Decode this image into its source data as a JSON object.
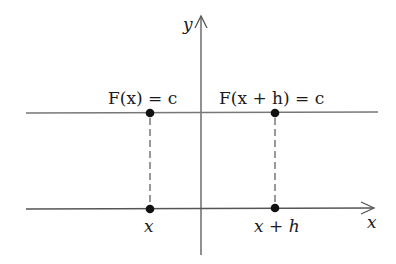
{
  "diagram": {
    "axes": {
      "x_label": "x",
      "y_label": "y"
    },
    "lines": {
      "top_line": "horizontal line y = c",
      "bottom_line": "x-axis"
    },
    "labels": {
      "left_top": "F(x) = c",
      "right_top": "F(x + h) = c",
      "left_bottom": "x",
      "right_bottom": "x + h"
    },
    "points": [
      {
        "name": "point-fx",
        "x": 150,
        "y": 113
      },
      {
        "name": "point-fxh",
        "x": 275,
        "y": 113
      },
      {
        "name": "point-x",
        "x": 150,
        "y": 209
      },
      {
        "name": "point-xh",
        "x": 275,
        "y": 209
      }
    ],
    "colors": {
      "line": "#555555",
      "dot": "#111111"
    }
  }
}
